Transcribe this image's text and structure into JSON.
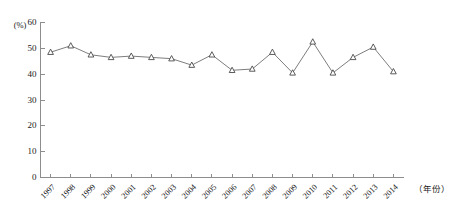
{
  "chart_data": {
    "type": "line",
    "title": "",
    "xlabel": "（年份）",
    "ylabel": "(%)",
    "ylim": [
      0,
      60
    ],
    "yticks": [
      0,
      10,
      20,
      30,
      40,
      50,
      60
    ],
    "grid": false,
    "legend": null,
    "marker": "triangle-up-open",
    "categories": [
      "1997",
      "1998",
      "1999",
      "2000",
      "2001",
      "2002",
      "2003",
      "2004",
      "2005",
      "2006",
      "2007",
      "2008",
      "2009",
      "2010",
      "2011",
      "2012",
      "2013",
      "2014"
    ],
    "values": [
      48.5,
      51.0,
      47.5,
      46.5,
      47.0,
      46.5,
      46.0,
      43.5,
      47.5,
      41.5,
      42.0,
      48.5,
      40.5,
      52.5,
      40.5,
      46.5,
      50.5,
      41.0
    ]
  },
  "axes": {
    "y_unit_label": "(%)",
    "x_axis_title": "（年份）"
  }
}
